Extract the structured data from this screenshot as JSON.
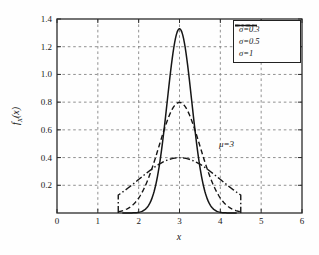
{
  "figure": {
    "ylabel_parts": [
      "f",
      "X",
      "(x)"
    ]
  },
  "chart_data": {
    "type": "line",
    "title": "",
    "xlabel": "x",
    "ylabel": "f_X(x)",
    "xlim": [
      0,
      6
    ],
    "ylim": [
      0,
      1.4
    ],
    "xticks": [
      0,
      1,
      2,
      3,
      4,
      5,
      6
    ],
    "yticks": [
      0.2,
      0.4,
      0.6,
      0.8,
      1.0,
      1.2,
      1.4
    ],
    "grid": true,
    "grid_style": "dashed",
    "legend_position": "top-right",
    "annotations": [
      {
        "text": "μ=3",
        "x": 4.15,
        "y": 0.5
      }
    ],
    "series": [
      {
        "name": "σ=0.3",
        "line_style": "solid",
        "distribution": "gaussian",
        "mu": 3,
        "sigma": 0.3,
        "x_range": [
          1.6,
          4.4
        ],
        "peak_x": 3,
        "peak_value": 1.33,
        "truncated": false
      },
      {
        "name": "σ=0.5",
        "line_style": "dashed",
        "distribution": "gaussian",
        "mu": 3,
        "sigma": 0.5,
        "x_range": [
          1.5,
          4.5
        ],
        "peak_x": 3,
        "peak_value": 0.8,
        "truncated": false
      },
      {
        "name": "σ=1",
        "line_style": "dash-dot",
        "distribution": "gaussian",
        "mu": 3,
        "sigma": 1,
        "x_range": [
          1.5,
          4.5
        ],
        "peak_x": 3,
        "peak_value": 0.4,
        "truncated": true,
        "truncation_edge_value": 0.13
      }
    ],
    "colors": {
      "line": "#161616",
      "grid": "#848484",
      "background": "#fefefe",
      "text": "#181818"
    }
  }
}
